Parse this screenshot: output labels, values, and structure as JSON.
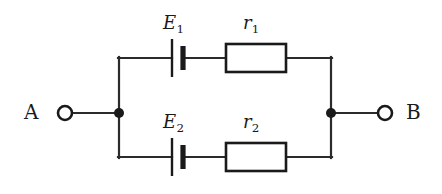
{
  "figure": {
    "kind": "electrical-circuit-diagram",
    "width": 442,
    "height": 194,
    "background_color": "#ffffff",
    "line_color": "#1a1a1a"
  },
  "terminals": [
    {
      "id": "A",
      "label": "A",
      "side": "left",
      "cx": 65,
      "cy": 113,
      "radius": 7
    },
    {
      "id": "B",
      "label": "B",
      "side": "right",
      "cx": 385,
      "cy": 113,
      "radius": 7
    }
  ],
  "junctions": [
    {
      "id": "left-node",
      "cx": 119,
      "cy": 113,
      "radius": 5
    },
    {
      "id": "right-node",
      "cx": 331,
      "cy": 113,
      "radius": 5
    }
  ],
  "branches": [
    {
      "id": "top-branch",
      "position": "top",
      "rail_y": 58,
      "battery": {
        "label": "E",
        "subscript": "1",
        "label_text": "E₁",
        "long_plate_x": 172,
        "short_plate_x": 183,
        "long_plate_half_height": 19,
        "short_plate_half_height": 12
      },
      "resistor": {
        "label": "r",
        "subscript": "1",
        "label_text": "r₁",
        "x": 226,
        "y": 44,
        "width": 60,
        "height": 28
      }
    },
    {
      "id": "bottom-branch",
      "position": "bottom",
      "rail_y": 157,
      "battery": {
        "label": "E",
        "subscript": "2",
        "label_text": "E₂",
        "long_plate_x": 172,
        "short_plate_x": 183,
        "long_plate_half_height": 19,
        "short_plate_half_height": 12
      },
      "resistor": {
        "label": "r",
        "subscript": "2",
        "label_text": "r₂",
        "x": 226,
        "y": 143,
        "width": 60,
        "height": 28
      }
    }
  ],
  "labels": {
    "terminal_a": "A",
    "terminal_b": "B",
    "emf_top_base": "E",
    "emf_top_sub": "1",
    "resistance_top_base": "r",
    "resistance_top_sub": "1",
    "emf_bottom_base": "E",
    "emf_bottom_sub": "2",
    "resistance_bottom_base": "r",
    "resistance_bottom_sub": "2"
  }
}
